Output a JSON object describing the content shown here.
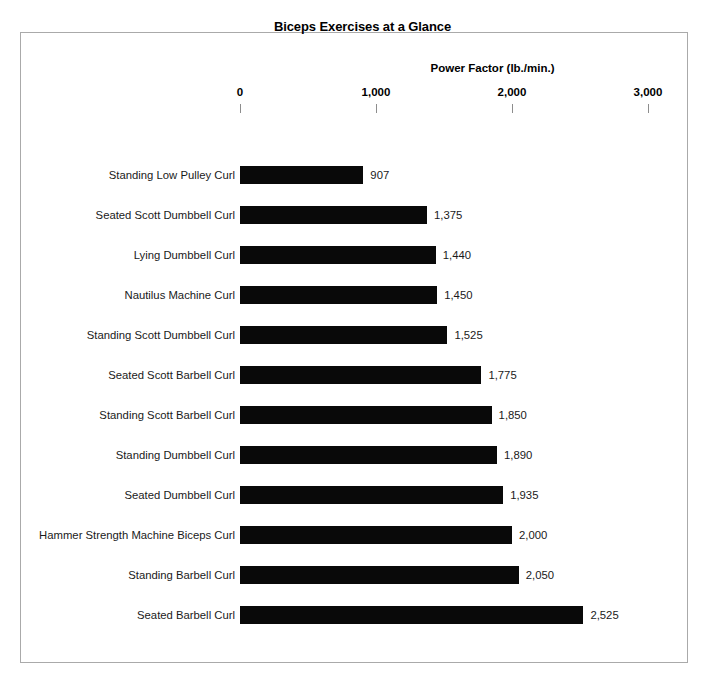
{
  "chart_data": {
    "type": "bar",
    "orientation": "horizontal",
    "title": "Biceps Exercises at a Glance",
    "xlabel": "Power Factor (lb./min.)",
    "ylabel": "",
    "xlim": [
      0,
      3000
    ],
    "xticks": [
      "0",
      "1,000",
      "2,000",
      "3,000"
    ],
    "xtick_values": [
      0,
      1000,
      2000,
      3000
    ],
    "grid": false,
    "legend": null,
    "bar_color": "#090909",
    "categories": [
      "Standing Low Pulley Curl",
      "Seated Scott Dumbbell Curl",
      "Lying Dumbbell Curl",
      "Nautilus Machine Curl",
      "Standing Scott Dumbbell Curl",
      "Seated Scott Barbell Curl",
      "Standing Scott Barbell Curl",
      "Standing Dumbbell Curl",
      "Seated Dumbbell Curl",
      "Hammer Strength Machine Biceps Curl",
      "Standing Barbell Curl",
      "Seated Barbell Curl"
    ],
    "values": [
      907,
      1375,
      1440,
      1450,
      1525,
      1775,
      1850,
      1890,
      1935,
      2000,
      2050,
      2525
    ],
    "value_labels": [
      "907",
      "1,375",
      "1,440",
      "1,450",
      "1,525",
      "1,775",
      "1,850",
      "1,890",
      "1,935",
      "2,000",
      "2,050",
      "2,525"
    ]
  }
}
